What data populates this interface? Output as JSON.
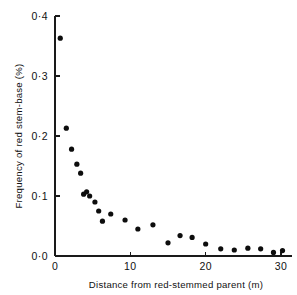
{
  "figure": {
    "background_color": "#ffffff",
    "marker_color": "#0d0d0d",
    "axis_color": "#1a1a1a"
  },
  "chart_data": {
    "type": "scatter",
    "title": "",
    "subtitle": "",
    "xlabel": "Distance from red-stemmed parent (m)",
    "ylabel": "Frequency of red stem-base (%)",
    "xlim": [
      0,
      31.5
    ],
    "ylim": [
      0.0,
      0.4
    ],
    "grid": false,
    "legend": null,
    "xticks": [
      0,
      10,
      20,
      30
    ],
    "xticklabels": [
      "0",
      "10",
      "20",
      "30"
    ],
    "yticks": [
      0.0,
      0.1,
      0.2,
      0.3,
      0.4
    ],
    "yticklabels": [
      "0·0",
      "0·1",
      "0·2",
      "0·3",
      "0·4"
    ],
    "marker": "filled-circle",
    "x": [
      0.7,
      1.5,
      2.2,
      2.9,
      3.4,
      3.8,
      4.2,
      4.6,
      5.3,
      5.8,
      6.3,
      7.4,
      9.3,
      11.0,
      13.0,
      15.0,
      16.6,
      18.2,
      20.0,
      22.0,
      23.8,
      25.6,
      27.3,
      29.0,
      30.2
    ],
    "y": [
      0.363,
      0.213,
      0.178,
      0.153,
      0.138,
      0.103,
      0.107,
      0.1,
      0.09,
      0.075,
      0.058,
      0.07,
      0.06,
      0.045,
      0.052,
      0.022,
      0.034,
      0.031,
      0.02,
      0.012,
      0.01,
      0.013,
      0.012,
      0.006,
      0.009
    ],
    "series": [
      {
        "name": "Frequency of red stem-base",
        "points": [
          {
            "x": 0.7,
            "y": 0.363
          },
          {
            "x": 1.5,
            "y": 0.213
          },
          {
            "x": 2.2,
            "y": 0.178
          },
          {
            "x": 2.9,
            "y": 0.153
          },
          {
            "x": 3.4,
            "y": 0.138
          },
          {
            "x": 3.8,
            "y": 0.103
          },
          {
            "x": 4.2,
            "y": 0.107
          },
          {
            "x": 4.6,
            "y": 0.1
          },
          {
            "x": 5.3,
            "y": 0.09
          },
          {
            "x": 5.8,
            "y": 0.075
          },
          {
            "x": 6.3,
            "y": 0.058
          },
          {
            "x": 7.4,
            "y": 0.07
          },
          {
            "x": 9.3,
            "y": 0.06
          },
          {
            "x": 11.0,
            "y": 0.045
          },
          {
            "x": 13.0,
            "y": 0.052
          },
          {
            "x": 15.0,
            "y": 0.022
          },
          {
            "x": 16.6,
            "y": 0.034
          },
          {
            "x": 18.2,
            "y": 0.031
          },
          {
            "x": 20.0,
            "y": 0.02
          },
          {
            "x": 22.0,
            "y": 0.012
          },
          {
            "x": 23.8,
            "y": 0.01
          },
          {
            "x": 25.6,
            "y": 0.013
          },
          {
            "x": 27.3,
            "y": 0.012
          },
          {
            "x": 29.0,
            "y": 0.006
          },
          {
            "x": 30.2,
            "y": 0.009
          }
        ]
      }
    ]
  }
}
